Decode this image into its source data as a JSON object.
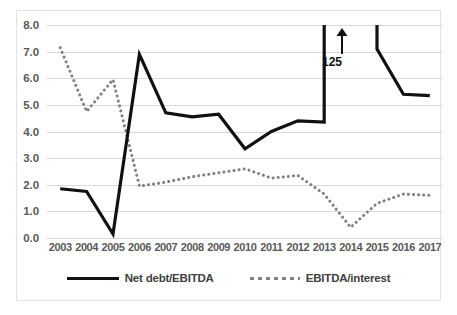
{
  "chart_data": {
    "type": "line",
    "title": "",
    "xlabel": "",
    "ylabel": "",
    "categories": [
      "2003",
      "2004",
      "2005",
      "2006",
      "2007",
      "2008",
      "2009",
      "2010",
      "2011",
      "2012",
      "2013",
      "2014",
      "2015",
      "2016",
      "2017"
    ],
    "ylim": [
      0.0,
      8.0
    ],
    "ytick_labels": [
      "8.0",
      "7.0",
      "6.0",
      "5.0",
      "4.0",
      "3.0",
      "2.0",
      "1.0",
      "0.0"
    ],
    "ytick_values": [
      8.0,
      7.0,
      6.0,
      5.0,
      4.0,
      3.0,
      2.0,
      1.0,
      0.0
    ],
    "grid": true,
    "legend_position": "bottom",
    "series": [
      {
        "name": "Net debt/EBITDA",
        "style": "solid",
        "color": "#111111",
        "values": [
          1.85,
          1.75,
          0.15,
          6.9,
          4.7,
          4.55,
          4.65,
          3.35,
          4.0,
          4.4,
          4.35,
          null,
          7.1,
          5.4,
          5.35
        ],
        "offscale_note": "2013 rises vertically off the top of the axis; 2014 value (125) is off-scale; line re-enters from top at 2015"
      },
      {
        "name": "EBITDA/interest",
        "style": "dotted",
        "color": "#808080",
        "values": [
          7.15,
          4.75,
          5.95,
          1.95,
          2.1,
          2.3,
          2.45,
          2.6,
          2.25,
          2.35,
          1.65,
          0.4,
          1.3,
          1.65,
          1.6
        ]
      }
    ],
    "annotations": [
      {
        "text": "125",
        "target_category": "2014",
        "arrow": "up"
      }
    ]
  },
  "legend": {
    "items": [
      {
        "label": "Net debt/EBITDA",
        "marker": "solid-line-swatch"
      },
      {
        "label": "EBITDA/interest",
        "marker": "dotted-line-swatch"
      }
    ]
  }
}
